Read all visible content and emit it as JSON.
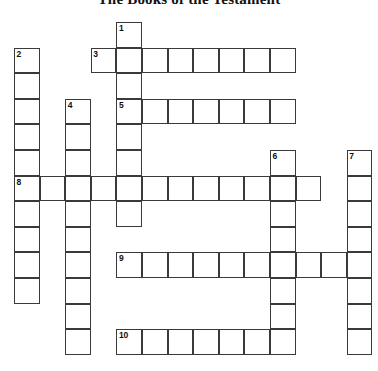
{
  "puzzle": {
    "title": "The Books of the Testament",
    "grid": {
      "origin_x": 14,
      "origin_y": 22,
      "cell_size": 25.6,
      "columns": 14,
      "rows": 14,
      "line_color": "#3a3a3a",
      "cell_fill": "#ffffff",
      "background": "#ffffff"
    },
    "entries": [
      {
        "number": "1",
        "direction": "down",
        "col": 4,
        "row": 0,
        "length": 8
      },
      {
        "number": "2",
        "direction": "down",
        "col": 0,
        "row": 1,
        "length": 10
      },
      {
        "number": "3",
        "direction": "across",
        "col": 3,
        "row": 1,
        "length": 8
      },
      {
        "number": "4",
        "direction": "down",
        "col": 2,
        "row": 3,
        "length": 10
      },
      {
        "number": "5",
        "direction": "across",
        "col": 4,
        "row": 3,
        "length": 7
      },
      {
        "number": "6",
        "direction": "down",
        "col": 10,
        "row": 5,
        "length": 8
      },
      {
        "number": "7",
        "direction": "down",
        "col": 13,
        "row": 5,
        "length": 8
      },
      {
        "number": "8",
        "direction": "across",
        "col": 0,
        "row": 6,
        "length": 12
      },
      {
        "number": "9",
        "direction": "across",
        "col": 4,
        "row": 9,
        "length": 10
      },
      {
        "number": "10",
        "direction": "across",
        "col": 4,
        "row": 12,
        "length": 7
      }
    ],
    "numbered_cells": [
      {
        "number": "1",
        "col": 4,
        "row": 0
      },
      {
        "number": "2",
        "col": 0,
        "row": 1
      },
      {
        "number": "3",
        "col": 3,
        "row": 1
      },
      {
        "number": "4",
        "col": 2,
        "row": 3
      },
      {
        "number": "5",
        "col": 4,
        "row": 3
      },
      {
        "number": "6",
        "col": 10,
        "row": 5
      },
      {
        "number": "7",
        "col": 13,
        "row": 5
      },
      {
        "number": "8",
        "col": 0,
        "row": 6
      },
      {
        "number": "9",
        "col": 4,
        "row": 9
      },
      {
        "number": "10",
        "col": 4,
        "row": 12
      }
    ]
  }
}
